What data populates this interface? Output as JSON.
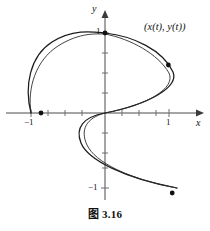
{
  "figure": {
    "caption": "图 3.16",
    "curve_label": "(x(t), y(t))",
    "axis_x_name": "x",
    "axis_y_name": "y",
    "colors": {
      "curve": "#1c1c1c",
      "axis": "#4a4a4a",
      "tick": "#6e6e6e",
      "marker": "#111111",
      "background": "#ffffff"
    }
  },
  "axes": {
    "x_tick_labels": [
      {
        "id": "x-neg1",
        "text": "−1",
        "value": -1
      },
      {
        "id": "x-pos1",
        "text": "1",
        "value": 1
      }
    ],
    "y_tick_labels": [
      {
        "id": "y-pos1",
        "text": "1",
        "value": 1
      },
      {
        "id": "y-neg1",
        "text": "−1",
        "value": -1
      }
    ]
  },
  "chart_data": {
    "type": "line",
    "title": "图 3.16",
    "xlabel": "x",
    "ylabel": "y",
    "xlim": [
      -1.35,
      1.35
    ],
    "ylim": [
      -1.35,
      1.35
    ],
    "grid": false,
    "legend": null,
    "annotations": [
      {
        "text": "(x(t), y(t))",
        "x": 1.0,
        "y": 1.1
      }
    ],
    "tick_spacing": 0.25,
    "x_ticks_labeled": [
      -1,
      1
    ],
    "y_ticks_labeled": [
      -1,
      1
    ],
    "markers": [
      {
        "label": "start",
        "x": -1.0,
        "y": 0.0
      },
      {
        "label": "top",
        "x": 0.0,
        "y": 1.0
      },
      {
        "label": "right",
        "x": 0.99,
        "y": 0.6
      },
      {
        "label": "end",
        "x": 1.05,
        "y": -1.0
      }
    ],
    "series": [
      {
        "name": "parametric-curve-outer",
        "comment": "S-shaped parametric spiral traced from (-1,0) up over the top to (0,1), bulging right to (1,0.6), back through the origin, looping left then sweeping down-right to (1.05,-1)",
        "path": "M 31 113 C 24 86 30 56 52 42 C 74 28 95 32 105 33 C 133 36 163 50 173 72 C 179 87 150 104 105 113 C 83 117 75 128 81 143 C 88 160 124 178 177 188"
      },
      {
        "name": "parametric-curve-inner",
        "comment": "second, slightly offset pass of the same spiral giving the doubled-line appearance",
        "path": "M 31 113 C 27 88 36 60 58 46 C 80 32 97 34 105 34 C 131 39 158 54 169 73 C 176 88 148 105 105 113 C 86 118 80 130 87 145 C 95 162 128 179 177 188"
      }
    ]
  }
}
